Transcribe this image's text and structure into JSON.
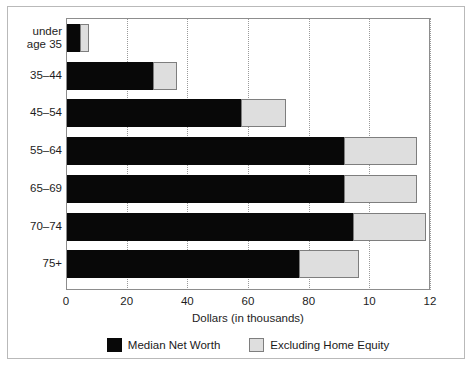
{
  "chart_data": {
    "type": "bar",
    "orientation": "horizontal",
    "stacked": true,
    "title": "",
    "xlabel": "Dollars (in thousands)",
    "ylabel": "",
    "xlim": [
      0,
      120
    ],
    "xticks": [
      0,
      20,
      40,
      60,
      80,
      100,
      120
    ],
    "xtick_labels": [
      "0",
      "20",
      "40",
      "60",
      "80",
      "10",
      "12"
    ],
    "grid": "vertical-dotted",
    "legend_position": "bottom-left",
    "categories": [
      "under age 35",
      "35–44",
      "45–54",
      "55–64",
      "65–69",
      "70–74",
      "75+"
    ],
    "series": [
      {
        "name": "Median Net Worth",
        "color": "#080808",
        "values": [
          5,
          29,
          58,
          92,
          92,
          95,
          77
        ]
      },
      {
        "name": "Excluding Home Equity",
        "color": "#dedede",
        "values": [
          3,
          8,
          15,
          24,
          24,
          24,
          20
        ]
      }
    ],
    "totals": [
      8,
      37,
      73,
      116,
      116,
      119,
      97
    ]
  },
  "legend": {
    "items": [
      {
        "label": "Median Net Worth",
        "swatch": "black-swatch"
      },
      {
        "label": "Excluding Home Equity",
        "swatch": "gray-swatch"
      }
    ]
  },
  "footer": {
    "source_note": ""
  }
}
